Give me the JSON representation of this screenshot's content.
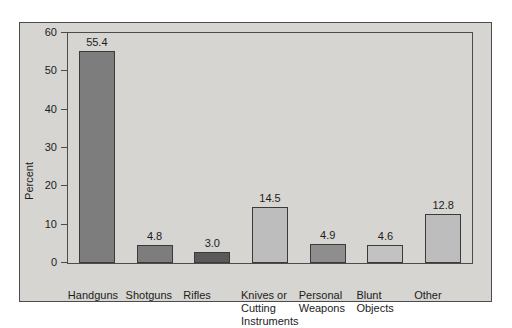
{
  "chart_data": {
    "type": "bar",
    "title": "",
    "xlabel": "",
    "ylabel": "Percent",
    "ylim": [
      0,
      60
    ],
    "yticks": [
      "0",
      "10",
      "20",
      "30",
      "40",
      "50",
      "60"
    ],
    "grid": false,
    "legend": "none",
    "categories": [
      "Handguns",
      "Shotguns",
      "Rifles",
      "Knives or\nCutting\nInstruments",
      "Personal\nWeapons",
      "Blunt\nObjects",
      "Other"
    ],
    "values": [
      55.4,
      4.8,
      3.0,
      14.5,
      4.9,
      4.6,
      12.8
    ],
    "value_labels": [
      "55.4",
      "4.8",
      "3.0",
      "14.5",
      "4.9",
      "4.6",
      "12.8"
    ],
    "bar_colors": [
      "#7d7d7d",
      "#7d7d7d",
      "#5a5a5a",
      "#bdbdbd",
      "#8e8e8e",
      "#c2c2c2",
      "#bdbdbd"
    ]
  },
  "figure": {
    "background": "#d6d5d1",
    "border_color": "#4c4c4c",
    "axis_color": "#4c4c4c",
    "text_color": "#1c1c1c"
  }
}
